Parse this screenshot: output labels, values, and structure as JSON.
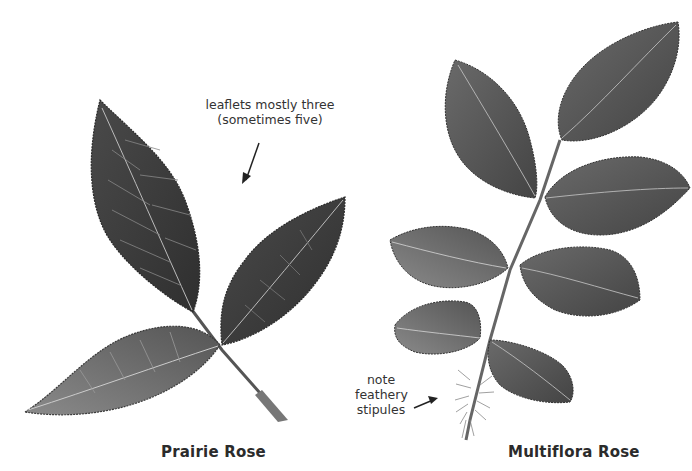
{
  "figure": {
    "panels": [
      {
        "id": "prairie-rose",
        "caption": "Prairie Rose",
        "annotation": {
          "lines": [
            "leaflets mostly three",
            "(sometimes five)"
          ]
        }
      },
      {
        "id": "multiflora-rose",
        "caption": "Multiflora Rose",
        "annotation": {
          "lines": [
            "note",
            "feathery",
            "stipules"
          ]
        }
      }
    ],
    "colors": {
      "background": "#ffffff",
      "leaf_dark": "#3a3a3a",
      "leaf_mid": "#5e5e5e",
      "leaf_light": "#8a8a8a",
      "vein": "#c8c8c8",
      "text": "#2b2b2b"
    }
  }
}
